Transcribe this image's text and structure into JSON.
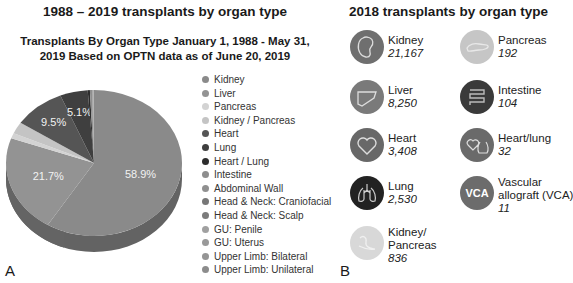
{
  "panel_a": {
    "label": "A",
    "title": "1988 – 2019 transplants by organ type",
    "subtitle_line1": "Transplants By Organ Type January 1, 1988 - May 31,",
    "subtitle_line2": "2019 Based on OPTN data as of June 20, 2019"
  },
  "panel_b": {
    "label": "B",
    "title": "2018 transplants by organ type",
    "organs": [
      {
        "name": "Kidney",
        "count": "21,167",
        "icon": "kidney-icon",
        "color": "#6f6f6f"
      },
      {
        "name": "Liver",
        "count": "8,250",
        "icon": "liver-icon",
        "color": "#7a7a7a"
      },
      {
        "name": "Heart",
        "count": "3,408",
        "icon": "heart-icon",
        "color": "#686868"
      },
      {
        "name": "Lung",
        "count": "2,530",
        "icon": "lungs-icon",
        "color": "#222222"
      },
      {
        "name_line1": "Kidney/",
        "name_line2": "Pancreas",
        "count": "836",
        "icon": "kidney-pancreas-icon",
        "color": "#d8d8d8"
      },
      {
        "name": "Pancreas",
        "count": "192",
        "icon": "pancreas-icon",
        "color": "#c6c6c6"
      },
      {
        "name": "Intestine",
        "count": "104",
        "icon": "intestine-icon",
        "color": "#3a3a3a"
      },
      {
        "name": "Heart/lung",
        "count": "32",
        "icon": "heart-lung-icon",
        "color": "#6a6a6a"
      },
      {
        "name_line1": "Vascular",
        "name_line2": "allograft (VCA)",
        "count": "11",
        "icon": "vca-icon",
        "icon_text": "VCA",
        "color": "#6c6c6c"
      }
    ]
  },
  "chart_data": {
    "type": "pie",
    "title": "Transplants By Organ Type January 1, 1988 - May 31, 2019 Based on OPTN data as of June 20, 2019",
    "style": "3d-tilted",
    "legend_position": "right",
    "categories": [
      "Kidney",
      "Liver",
      "Pancreas",
      "Kidney / Pancreas",
      "Heart",
      "Lung",
      "Heart / Lung",
      "Intestine",
      "Abdominal Wall",
      "Head & Neck: Craniofacial",
      "Head & Neck: Scalp",
      "GU: Penile",
      "GU: Uterus",
      "Upper Limb: Bilateral",
      "Upper Limb: Unilateral"
    ],
    "values": [
      58.9,
      21.7,
      1.2,
      2.6,
      9.5,
      5.1,
      0.4,
      0.4,
      0.05,
      0.05,
      0.05,
      0.05,
      0.05,
      0.05,
      0.05
    ],
    "data_labels": [
      "58.9%",
      "21.7%",
      "",
      "",
      "9.5%",
      "5.1%",
      "",
      "",
      "",
      "",
      "",
      "",
      "",
      "",
      ""
    ],
    "colors": [
      "#8a8a8a",
      "#939393",
      "#d3d3d3",
      "#c4c4c4",
      "#555555",
      "#3f3f3f",
      "#2c2c2c",
      "#8e8e8e",
      "#909090",
      "#777777",
      "#7c7c7c",
      "#a0a0a0",
      "#999999",
      "#959595",
      "#8c8c8c"
    ]
  }
}
